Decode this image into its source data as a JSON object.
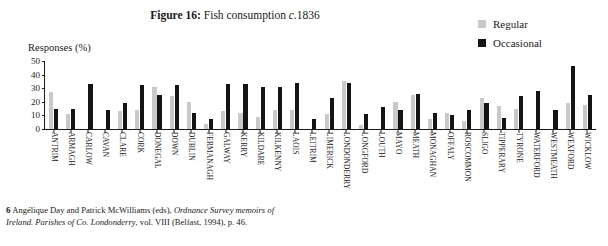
{
  "figure": {
    "label": "Figure 16:",
    "caption_plain": "Fish consumption ",
    "caption_italic": "c.",
    "caption_year": "1836",
    "full_title": "Figure 16: Fish consumption c.1836"
  },
  "legend": {
    "items": [
      {
        "label": "Regular",
        "color": "#c9c9c9",
        "icon": "square-swatch-icon"
      },
      {
        "label": "Occasional",
        "color": "#141414",
        "icon": "square-swatch-icon"
      }
    ]
  },
  "axis": {
    "y_title": "Responses (%)",
    "y_ticks": [
      "0",
      "10",
      "20",
      "30",
      "40",
      "50"
    ]
  },
  "footnote": {
    "number": "6",
    "text_a": " Angélique Day and Patrick McWilliams (eds), ",
    "text_italic_a": "Ordnance Survey memoirs of Ireland. Parishes of Co. Londonderry",
    "text_b": ", vol. VIII (Belfast, 1994), p. 46."
  },
  "chart_data": {
    "type": "bar",
    "xlabel": "",
    "ylabel": "Responses (%)",
    "ylim": [
      0,
      50
    ],
    "ytick_step": 10,
    "grid": false,
    "legend_position": "top-right",
    "categories": [
      "ANTRIM",
      "ARMAGH",
      "CARLOW",
      "CAVAN",
      "CLARE",
      "CORK",
      "DONEGAL",
      "DOWN",
      "DUBLIN",
      "FERMANAGH",
      "GALWAY",
      "KERRY",
      "KILDARE",
      "KILKENNY",
      "LAOIS",
      "LEITRIM",
      "LIMERICK",
      "LONDONDERRY",
      "LONGFORD",
      "LOUTH",
      "MAYO",
      "MEATH",
      "MONAGHAN",
      "OFFALY",
      "ROSCOMMON",
      "SLIGO",
      "TIPPERARY",
      "TYRONE",
      "WATERFORD",
      "WESTMEATH",
      "WEXFORD",
      "WICKLOW"
    ],
    "series": [
      {
        "name": "Regular",
        "color": "#c9c9c9",
        "values": [
          27,
          11,
          0,
          0,
          13,
          14,
          31,
          24,
          20,
          4,
          13,
          12,
          9,
          14,
          14,
          0,
          11,
          35,
          3,
          0,
          20,
          25,
          7,
          12,
          6,
          23,
          17,
          15,
          0,
          0,
          19,
          18
        ]
      },
      {
        "name": "Occasional",
        "color": "#141414",
        "values": [
          15,
          15,
          33,
          14,
          19,
          32,
          25,
          32,
          12,
          7,
          33,
          33,
          31,
          31,
          34,
          7,
          23,
          34,
          11,
          16,
          14,
          26,
          12,
          10,
          14,
          19,
          8,
          24,
          28,
          14,
          46,
          25
        ]
      }
    ]
  }
}
